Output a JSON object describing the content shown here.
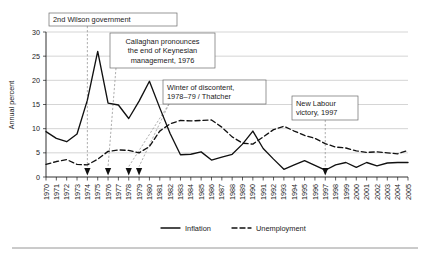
{
  "chart_data": {
    "type": "line",
    "title": "",
    "xlabel": "",
    "ylabel": "Annual percent",
    "xlim": [
      1970,
      2005
    ],
    "ylim": [
      0,
      30
    ],
    "yticks": [
      0,
      5,
      10,
      15,
      20,
      25,
      30
    ],
    "grid": "horizontal",
    "legend_position": "bottom-center",
    "x": [
      1970,
      1971,
      1972,
      1973,
      1974,
      1975,
      1976,
      1977,
      1978,
      1979,
      1980,
      1981,
      1982,
      1983,
      1984,
      1985,
      1986,
      1987,
      1988,
      1989,
      1990,
      1991,
      1992,
      1993,
      1994,
      1995,
      1996,
      1997,
      1998,
      1999,
      2000,
      2001,
      2002,
      2003,
      2004,
      2005
    ],
    "xtick_labels": [
      "1970",
      "1971",
      "1972",
      "1973",
      "1974",
      "1975",
      "1976",
      "1977",
      "1978",
      "1979",
      "1980",
      "1981",
      "1982",
      "1983",
      "1984",
      "1985",
      "1986",
      "1987",
      "1988",
      "1989",
      "1990",
      "1991",
      "1992",
      "1993",
      "1994",
      "1995",
      "1996",
      "1997",
      "1998",
      "1999",
      "2000",
      "2001",
      "2002",
      "2003",
      "2004",
      "2005"
    ],
    "series": [
      {
        "name": "Inflation",
        "style": "solid",
        "color": "#111111",
        "values": [
          9.4,
          8.0,
          7.3,
          8.9,
          15.9,
          26.0,
          15.3,
          14.9,
          12.1,
          15.7,
          19.8,
          14.3,
          9.0,
          4.6,
          4.7,
          5.2,
          3.5,
          4.1,
          4.7,
          6.8,
          9.5,
          5.9,
          3.7,
          1.6,
          2.5,
          3.4,
          2.4,
          1.4,
          2.5,
          3.0,
          2.0,
          3.0,
          2.3,
          2.9,
          3.0,
          3.0
        ]
      },
      {
        "name": "Unemployment",
        "style": "dashed",
        "color": "#111111",
        "values": [
          2.6,
          3.2,
          3.6,
          2.6,
          2.5,
          3.7,
          5.3,
          5.6,
          5.5,
          5.0,
          6.3,
          9.5,
          11.0,
          11.7,
          11.6,
          11.7,
          11.8,
          10.3,
          8.3,
          7.0,
          6.8,
          8.3,
          9.8,
          10.5,
          9.5,
          8.6,
          8.0,
          6.9,
          6.2,
          6.0,
          5.4,
          5.1,
          5.2,
          5.0,
          4.8,
          5.5
        ]
      }
    ],
    "annotations": [
      {
        "id": "second-wilson-government",
        "lines": [
          "2nd Wilson government"
        ],
        "align": "left",
        "target_year": 1974,
        "box": {
          "x": 49,
          "y": 13,
          "w": 128,
          "h": 13
        }
      },
      {
        "id": "callaghan-keynesian",
        "lines": [
          "Callaghan pronounces",
          "the end of Keynesian",
          "management, 1976"
        ],
        "align": "center",
        "target_year": 1976,
        "box": {
          "x": 110,
          "y": 33,
          "w": 105,
          "h": 35
        }
      },
      {
        "id": "winter-of-discontent",
        "lines": [
          "Winter of discontent,",
          "1978–79 / Thatcher"
        ],
        "align": "left",
        "target_year": 1978,
        "target_year_2": 1979,
        "box": {
          "x": 163,
          "y": 80,
          "w": 103,
          "h": 24
        }
      },
      {
        "id": "new-labour-victory",
        "lines": [
          "New Labour",
          "victory, 1997"
        ],
        "align": "left",
        "target_year": 1997,
        "box": {
          "x": 292,
          "y": 96,
          "w": 66,
          "h": 24
        }
      }
    ],
    "event_markers": [
      1974,
      1976,
      1978,
      1979,
      1997
    ]
  },
  "legend": {
    "items": [
      {
        "label": "Inflation",
        "style": "solid"
      },
      {
        "label": "Unemployment",
        "style": "dashed"
      }
    ]
  },
  "axes": {
    "y_axis_title": "Annual percent"
  }
}
